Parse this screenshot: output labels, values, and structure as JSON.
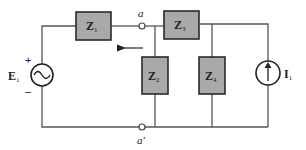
{
  "diagram": {
    "type": "circuit",
    "components": {
      "Z1": {
        "main": "Z",
        "sub": "1"
      },
      "Z2": {
        "main": "Z",
        "sub": "2"
      },
      "Z3": {
        "main": "Z",
        "sub": "3"
      },
      "Z4": {
        "main": "Z",
        "sub": "4"
      },
      "E1": {
        "main": "E",
        "sub": "1",
        "kind": "ac-voltage-source"
      },
      "I1": {
        "main": "I",
        "sub": "1",
        "kind": "current-source"
      }
    },
    "nodes": {
      "a": "a",
      "a_prime": "a′"
    },
    "polarity": {
      "plus": "+",
      "minus": "–"
    },
    "colors": {
      "box_fill": "#a9a9a9",
      "wire": "#555555"
    }
  }
}
